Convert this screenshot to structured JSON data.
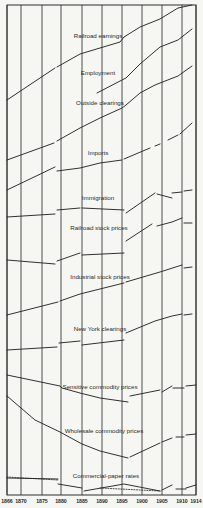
{
  "chart_data": {
    "type": "line",
    "title": "",
    "xlabel": "",
    "ylabel": "",
    "grid": true,
    "x_ticks": [
      "1866",
      "1870",
      "1875",
      "1880",
      "1885",
      "1890",
      "1895",
      "1900",
      "1905",
      "1910",
      "1914"
    ],
    "xlim": [
      1866,
      1914
    ],
    "note": "Stacked index curves (each on its own vertical band, relative scale, no y-axis values shown). Points are [year, relative y-position in px].",
    "layout": {
      "plot_left": 7,
      "plot_right": 196,
      "plot_top": 5,
      "plot_bottom": 495,
      "tick_x": [
        7,
        21,
        42,
        61,
        82,
        102,
        122,
        142,
        162,
        182,
        196
      ],
      "tick_label_y": 503
    },
    "series": [
      {
        "name": "Railroad earnings",
        "label_pos": [
          98,
          38
        ],
        "segments": [
          [
            [
              7,
              100
            ],
            [
              55,
              68
            ]
          ],
          [
            [
              57,
              67
            ],
            [
              80,
              54
            ],
            [
              120,
              42
            ],
            [
              124,
              37
            ],
            [
              140,
              27
            ],
            [
              160,
              19
            ],
            [
              178,
              8
            ],
            [
              192,
              5
            ]
          ]
        ]
      },
      {
        "name": "Employment",
        "label_pos": [
          98,
          75
        ],
        "segments": [
          [
            [
              97,
              93
            ],
            [
              122,
              80
            ],
            [
              126,
              78
            ],
            [
              140,
              64
            ],
            [
              160,
              47
            ],
            [
              178,
              40
            ],
            [
              192,
              29
            ]
          ]
        ]
      },
      {
        "name": "Outside clearings",
        "label_pos": [
          100,
          105
        ],
        "segments": [
          [
            [
              7,
              160
            ],
            [
              54,
              143
            ]
          ],
          [
            [
              57,
              141
            ],
            [
              80,
              128
            ],
            [
              100,
              118
            ],
            [
              122,
              108
            ],
            [
              126,
              105
            ],
            [
              140,
              93
            ],
            [
              155,
              85
            ],
            [
              160,
              83
            ],
            [
              178,
              76
            ],
            [
              192,
              66
            ]
          ]
        ]
      },
      {
        "name": "Imports",
        "label_pos": [
          98,
          155
        ],
        "segments": [
          [
            [
              7,
              190
            ],
            [
              55,
              167
            ]
          ],
          [
            [
              57,
              171
            ],
            [
              80,
              168
            ],
            [
              100,
              163
            ],
            [
              122,
              160
            ]
          ],
          [
            [
              124,
              159
            ],
            [
              150,
              148
            ]
          ],
          [
            [
              155,
              146
            ],
            [
              160,
              144
            ]
          ],
          [
            [
              168,
              140
            ],
            [
              178,
              135
            ]
          ],
          [
            [
              180,
              134
            ],
            [
              192,
              123
            ]
          ]
        ]
      },
      {
        "name": "Immigration",
        "label_pos": [
          98,
          200
        ],
        "segments": [
          [
            [
              7,
              217
            ],
            [
              55,
              214
            ]
          ],
          [
            [
              57,
              210
            ],
            [
              80,
              208
            ]
          ],
          [
            [
              82,
              208
            ],
            [
              124,
              210
            ]
          ],
          [
            [
              126,
              213
            ],
            [
              155,
              193
            ]
          ],
          [
            [
              157,
              194
            ],
            [
              172,
              198
            ]
          ],
          [
            [
              172,
              193
            ],
            [
              182,
              192
            ]
          ],
          [
            [
              184,
              191
            ],
            [
              192,
              190
            ]
          ]
        ]
      },
      {
        "name": "Railroad stock prices",
        "label_pos": [
          99,
          230
        ],
        "segments": [
          [
            [
              7,
              260
            ],
            [
              55,
              264
            ]
          ],
          [
            [
              57,
              261
            ],
            [
              80,
              253
            ]
          ],
          [
            [
              82,
              255
            ],
            [
              124,
              253
            ]
          ],
          [
            [
              126,
              241
            ],
            [
              152,
              224
            ]
          ],
          [
            [
              157,
              226
            ],
            [
              172,
              222
            ],
            [
              182,
              218
            ]
          ],
          [
            [
              184,
              223
            ],
            [
              192,
              223
            ]
          ]
        ]
      },
      {
        "name": "Industrial stock prices",
        "label_pos": [
          100,
          279
        ],
        "segments": [
          [
            [
              7,
              315
            ],
            [
              58,
              302
            ]
          ],
          [
            [
              60,
              301
            ],
            [
              80,
              294
            ],
            [
              124,
              283
            ]
          ],
          [
            [
              126,
              282
            ],
            [
              160,
              272
            ],
            [
              182,
              265
            ]
          ],
          [
            [
              184,
              268
            ],
            [
              192,
              267
            ]
          ]
        ]
      },
      {
        "name": "New York clearings",
        "label_pos": [
          100,
          331
        ],
        "segments": [
          [
            [
              7,
              350
            ],
            [
              57,
              347
            ]
          ],
          [
            [
              59,
              343
            ],
            [
              80,
              341
            ]
          ],
          [
            [
              82,
              345
            ],
            [
              124,
              340
            ]
          ],
          [
            [
              126,
              333
            ],
            [
              155,
              321
            ],
            [
              172,
              316
            ],
            [
              182,
              314
            ]
          ],
          [
            [
              184,
              315
            ],
            [
              192,
              314
            ]
          ]
        ]
      },
      {
        "name": "Sensitive commodity prices",
        "label_pos": [
          100,
          389
        ],
        "segments": [
          [
            [
              7,
              375
            ],
            [
              60,
              386
            ],
            [
              62,
              388
            ],
            [
              80,
              393
            ],
            [
              100,
              398
            ],
            [
              128,
              402
            ]
          ],
          [
            [
              130,
              396
            ],
            [
              160,
              390
            ]
          ],
          [
            [
              162,
              392
            ],
            [
              172,
              386
            ]
          ],
          [
            [
              173,
              388
            ],
            [
              184,
              388
            ]
          ],
          [
            [
              186,
              386
            ],
            [
              196,
              385
            ]
          ]
        ]
      },
      {
        "name": "Wholesale commodity prices",
        "label_pos": [
          104,
          433
        ],
        "segments": [
          [
            [
              7,
              396
            ],
            [
              35,
              420
            ],
            [
              60,
              432
            ],
            [
              82,
              444
            ],
            [
              100,
              451
            ],
            [
              128,
              458
            ]
          ],
          [
            [
              130,
              457
            ],
            [
              160,
              443
            ]
          ],
          [
            [
              162,
              442
            ],
            [
              172,
              438
            ]
          ],
          [
            [
              176,
              437
            ],
            [
              184,
              437
            ]
          ],
          [
            [
              186,
              435
            ],
            [
              196,
              434
            ]
          ]
        ]
      },
      {
        "name": "Commercial-paper rates",
        "label_pos": [
          106,
          478
        ],
        "segments": [
          [
            [
              7,
              478
            ],
            [
              58,
              479
            ]
          ],
          [
            [
              58,
              484
            ],
            [
              82,
              488
            ]
          ],
          [
            [
              84,
              491
            ],
            [
              124,
              484
            ],
            [
              160,
              491
            ]
          ],
          [
            [
              162,
              490
            ],
            [
              172,
              485
            ]
          ],
          [
            [
              176,
              489
            ],
            [
              186,
              489
            ]
          ],
          [
            [
              186,
              488
            ],
            [
              196,
              485
            ]
          ]
        ],
        "dotted_segments": [
          [
            [
              7,
              477
            ],
            [
              58,
              480
            ]
          ],
          [
            [
              100,
              488
            ],
            [
              160,
              491
            ]
          ]
        ]
      }
    ]
  }
}
